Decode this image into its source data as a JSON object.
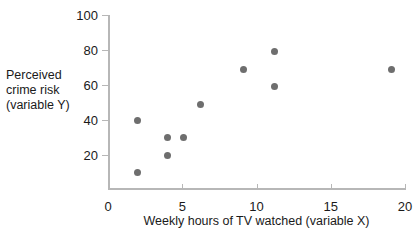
{
  "chart_data": {
    "type": "scatter",
    "title": "",
    "xlabel": "Weekly hours of TV watched (variable X)",
    "ylabel": "Perceived crime risk (variable Y)",
    "ylabel_lines": [
      "Perceived",
      "crime risk",
      "(variable Y)"
    ],
    "xlim": [
      0,
      20
    ],
    "ylim": [
      0,
      100
    ],
    "xticks": [
      0,
      5,
      10,
      15,
      20
    ],
    "xtick_labels": [
      "0",
      "5",
      "10",
      "15",
      "20"
    ],
    "yticks": [
      20,
      40,
      60,
      80,
      100
    ],
    "ytick_labels": [
      "20",
      "40",
      "60",
      "80",
      "100"
    ],
    "grid": false,
    "legend": null,
    "marker": "filled-circle",
    "marker_color": "#6e6e6e",
    "axis_color": "#b7b7b7",
    "text_color": "#1a1a1a",
    "points": [
      {
        "x": 2.0,
        "y": 10
      },
      {
        "x": 2.0,
        "y": 40
      },
      {
        "x": 4.0,
        "y": 20
      },
      {
        "x": 4.0,
        "y": 30
      },
      {
        "x": 5.1,
        "y": 30
      },
      {
        "x": 6.2,
        "y": 49
      },
      {
        "x": 9.1,
        "y": 69
      },
      {
        "x": 11.2,
        "y": 59
      },
      {
        "x": 11.2,
        "y": 79
      },
      {
        "x": 19.1,
        "y": 69
      }
    ]
  }
}
